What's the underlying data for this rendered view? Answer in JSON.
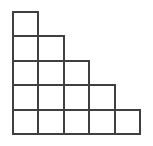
{
  "figure": {
    "name": "staircase-square-grid",
    "title": "Staircase arrangement of unit squares",
    "total_squares": "15",
    "row_count": "5",
    "column_count": "5",
    "shape_type": "staircase",
    "alignment": "left-bottom"
  },
  "canvas": {
    "width": 153,
    "height": 146,
    "background_color": "#ffffff"
  },
  "geometry": {
    "origin_x": 13,
    "origin_y": 12,
    "cell_width": 25.4,
    "cell_height": 24.4,
    "stroke_width": 2,
    "stroke_color": "#3f3f3f",
    "fill_color": "#ffffff"
  },
  "rows": [
    {
      "index": "1",
      "label": "row-1",
      "cells": 1,
      "y_top": 12
    },
    {
      "index": "2",
      "label": "row-2",
      "cells": 2,
      "y_top": 36.4
    },
    {
      "index": "3",
      "label": "row-3",
      "cells": 3,
      "y_top": 60.8
    },
    {
      "index": "4",
      "label": "row-4",
      "cells": 4,
      "y_top": 85.2
    },
    {
      "index": "5",
      "label": "row-5",
      "cells": 5,
      "y_top": 109.6
    }
  ],
  "columns": [
    {
      "index": "1",
      "label": "col-1",
      "x_left": 13
    },
    {
      "index": "2",
      "label": "col-2",
      "x_left": 38.4
    },
    {
      "index": "3",
      "label": "col-3",
      "x_left": 63.8
    },
    {
      "index": "4",
      "label": "col-4",
      "x_left": 89.2
    },
    {
      "index": "5",
      "label": "col-5",
      "x_left": 114.6
    }
  ]
}
